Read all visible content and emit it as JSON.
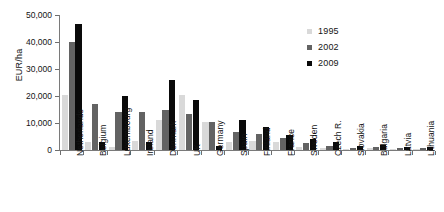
{
  "chart_data": {
    "type": "bar",
    "title": "",
    "subtitle": "",
    "xlabel": "",
    "ylabel": "EUR/ha",
    "ylim": [
      0,
      50000
    ],
    "ytick_labels": [
      "50,000",
      "40,000",
      "30,000",
      "20,000",
      "10,000",
      "0"
    ],
    "ytick_values": [
      50000,
      40000,
      30000,
      20000,
      10000,
      0
    ],
    "grid": false,
    "legend_position": "top-right",
    "categories": [
      "Netherlands",
      "Belgium",
      "Luxembourg",
      "Ireland",
      "Denmark",
      "UK",
      "Germany",
      "Spain",
      "Finland",
      "France",
      "Sweden",
      "Czech R.",
      "Slovakia",
      "Bulgaria",
      "Latvia",
      "Lithuania"
    ],
    "series": [
      {
        "name": "1995",
        "color": "#d9d9d9",
        "values": [
          20500,
          3000,
          1200,
          3200,
          11000,
          20500,
          10500,
          3000,
          3500,
          3000,
          1300,
          700,
          500,
          600,
          400,
          300
        ]
      },
      {
        "name": "2002",
        "color": "#636363",
        "values": [
          40000,
          17000,
          14000,
          14000,
          15000,
          13500,
          10500,
          6500,
          6000,
          4500,
          2600,
          1500,
          900,
          1100,
          900,
          600
        ]
      },
      {
        "name": "2009",
        "color": "#0a0a0a",
        "values": [
          46500,
          3000,
          20000,
          3000,
          26000,
          18500,
          1500,
          11000,
          8500,
          5500,
          4000,
          3000,
          1500,
          1700,
          1200,
          1100
        ]
      }
    ]
  },
  "legend": {
    "entries": [
      {
        "label": "1995",
        "color": "#d9d9d9"
      },
      {
        "label": "2002",
        "color": "#636363"
      },
      {
        "label": "2009",
        "color": "#0a0a0a"
      }
    ]
  }
}
